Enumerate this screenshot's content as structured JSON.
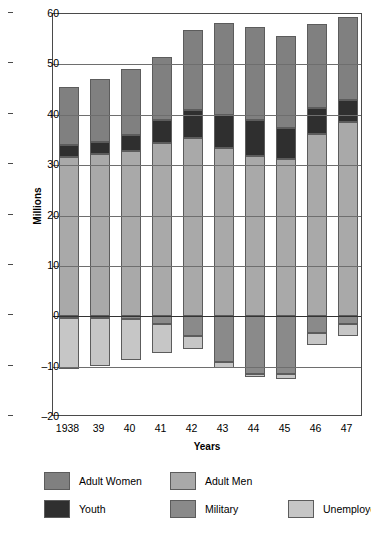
{
  "chart_data": {
    "type": "bar",
    "title": "",
    "subtitle": "",
    "stacked": true,
    "xlabel": "Years",
    "ylabel": "Millions",
    "ylim": [
      -20,
      60
    ],
    "yticks": [
      60,
      50,
      40,
      30,
      20,
      10,
      0,
      -10,
      -20
    ],
    "ytick_labels": [
      "60",
      "50",
      "40",
      "30",
      "20",
      "10",
      "0",
      "–10",
      "–20"
    ],
    "grid": true,
    "legend_position": "bottom",
    "categories": [
      "1938",
      "39",
      "40",
      "41",
      "42",
      "43",
      "44",
      "45",
      "46",
      "47"
    ],
    "series": [
      {
        "name": "Adult Men",
        "color": "#a9a9a9",
        "direction": "positive",
        "stack_order": 1,
        "values": [
          31.6,
          32.2,
          32.9,
          34.3,
          35.4,
          33.4,
          31.9,
          31.3,
          36.2,
          38.6
        ]
      },
      {
        "name": "Youth",
        "color": "#2f2f2f",
        "direction": "positive",
        "stack_order": 2,
        "values": [
          2.4,
          2.4,
          3.0,
          4.7,
          5.6,
          6.5,
          7.0,
          6.0,
          5.2,
          4.3
        ]
      },
      {
        "name": "Adult Women",
        "color": "#808080",
        "direction": "positive",
        "stack_order": 3,
        "values": [
          11.6,
          12.5,
          13.2,
          12.4,
          15.8,
          18.3,
          18.6,
          18.3,
          16.7,
          16.6
        ]
      },
      {
        "name": "Military",
        "color": "#8a8a8a",
        "direction": "negative",
        "stack_order": 1,
        "values": [
          0.3,
          0.4,
          0.5,
          1.6,
          3.9,
          9.1,
          11.4,
          11.4,
          3.4,
          1.6
        ]
      },
      {
        "name": "Unemployed",
        "color": "#c6c6c6",
        "direction": "negative",
        "stack_order": 2,
        "values": [
          10.1,
          9.5,
          8.1,
          5.6,
          2.7,
          1.1,
          0.7,
          1.0,
          2.3,
          2.3
        ]
      }
    ],
    "totals_positive": [
      45.6,
      47.1,
      49.1,
      51.4,
      56.8,
      58.2,
      57.5,
      55.6,
      58.1,
      59.5
    ],
    "totals_negative": [
      -10.4,
      -9.9,
      -8.6,
      -7.2,
      -6.6,
      -10.2,
      -12.1,
      -12.4,
      -5.7,
      -3.9
    ]
  },
  "axis": {
    "y_title": "Millions",
    "x_title": "Years",
    "y_tick_labels": [
      "60",
      "50",
      "40",
      "30",
      "20",
      "10",
      "0",
      "–10",
      "–20"
    ],
    "x_tick_labels": [
      "1938",
      "39",
      "40",
      "41",
      "42",
      "43",
      "44",
      "45",
      "46",
      "47"
    ]
  },
  "legend": {
    "items": [
      {
        "label": "Adult Women",
        "color": "#808080"
      },
      {
        "label": "Adult Men",
        "color": "#a9a9a9"
      },
      {
        "label": "Youth",
        "color": "#2f2f2f"
      },
      {
        "label": "Military",
        "color": "#8a8a8a"
      },
      {
        "label": "Unemployed",
        "color": "#c6c6c6"
      }
    ]
  }
}
